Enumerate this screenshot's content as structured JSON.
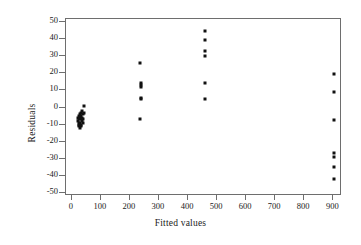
{
  "chart_data": {
    "type": "scatter",
    "title": "",
    "xlabel": "Fitted values",
    "ylabel": "Residuals",
    "xlim": [
      -20,
      930
    ],
    "ylim": [
      -52,
      52
    ],
    "grid": false,
    "legend": null,
    "xticks": [
      0,
      100,
      200,
      300,
      400,
      500,
      600,
      700,
      800,
      900
    ],
    "yticks": [
      50,
      40,
      30,
      20,
      10,
      0,
      -10,
      -20,
      -30,
      -40,
      -50
    ],
    "marker": "filled-square",
    "marker_color": "#111111",
    "series": [
      {
        "name": "residuals",
        "points": [
          [
            22,
            -6
          ],
          [
            23,
            -8
          ],
          [
            24,
            -9
          ],
          [
            24,
            -11
          ],
          [
            25,
            -5
          ],
          [
            26,
            -7
          ],
          [
            26,
            -10
          ],
          [
            27,
            -12
          ],
          [
            28,
            -4
          ],
          [
            29,
            -6
          ],
          [
            29,
            -9
          ],
          [
            30,
            -11
          ],
          [
            31,
            -3
          ],
          [
            32,
            -7
          ],
          [
            32,
            -10
          ],
          [
            33,
            -5
          ],
          [
            34,
            -8
          ],
          [
            35,
            -2
          ],
          [
            36,
            -6
          ],
          [
            37,
            -9
          ],
          [
            38,
            -4
          ],
          [
            40,
            -7
          ],
          [
            42,
            1
          ],
          [
            43,
            -3
          ],
          [
            236,
            26
          ],
          [
            237,
            14.5
          ],
          [
            237,
            13
          ],
          [
            237,
            12
          ],
          [
            237,
            5.5
          ],
          [
            237,
            5
          ],
          [
            236,
            -6.5
          ],
          [
            459,
            45
          ],
          [
            459,
            39.5
          ],
          [
            459,
            33
          ],
          [
            459,
            30.5
          ],
          [
            459,
            14.5
          ],
          [
            459,
            5
          ],
          [
            901,
            19.5
          ],
          [
            901,
            9
          ],
          [
            901,
            -7.5
          ],
          [
            901,
            -27
          ],
          [
            901,
            -29
          ],
          [
            901,
            -35
          ],
          [
            901,
            -42
          ]
        ]
      }
    ]
  },
  "axes": {
    "x_title": "Fitted values",
    "y_title": "Residuals",
    "x_tick_labels": [
      "0",
      "100",
      "200",
      "300",
      "400",
      "500",
      "600",
      "700",
      "800",
      "900"
    ],
    "y_tick_labels": [
      "50",
      "40",
      "30",
      "20",
      "10",
      "0",
      "-10",
      "-20",
      "-30",
      "-40",
      "-50"
    ]
  },
  "style": {
    "frame_color": "#6e6e6e",
    "marker_color": "#111111",
    "background": "#ffffff"
  }
}
